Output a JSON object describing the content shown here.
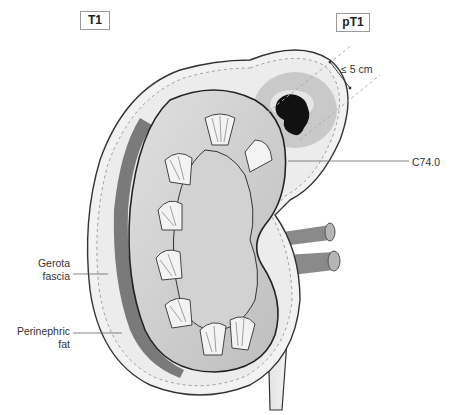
{
  "figure": {
    "type": "anatomical-diagram",
    "stage_labels": {
      "clinical": "T1",
      "pathological": "pT1"
    },
    "annotations": {
      "tumor_size": "≤ 5 cm",
      "icd_code": "C74.0",
      "gerota_fascia": [
        "Gerota",
        "fascia"
      ],
      "perinephric_fat": [
        "Perinephric",
        "fat"
      ]
    },
    "colors": {
      "tumor": "#111111",
      "tumor_halo": "#c8c8c8",
      "cortex": "#cfcfcf",
      "medulla": "#e6e6e6",
      "fascia_dark": "#777777",
      "fat": "#eeeeee",
      "outline": "#333333",
      "vessels": "#8a8a8a",
      "dashed": "#aaaaaa"
    }
  }
}
